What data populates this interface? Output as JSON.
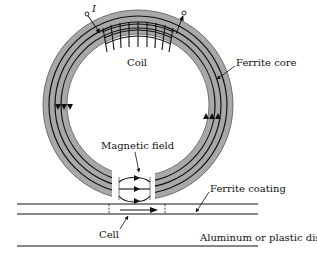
{
  "diagram": {
    "labels": {
      "current": "I",
      "coil": "Coil",
      "ferrite_core": "Ferrite core",
      "magnetic_field": "Magnetic field",
      "ferrite_coating": "Ferrite coating",
      "cell": "Cell",
      "disk": "Aluminum or plastic disk"
    },
    "colors": {
      "core_fill": "#a8a8a8",
      "lines": "#111111",
      "background": "#ffffff"
    }
  }
}
